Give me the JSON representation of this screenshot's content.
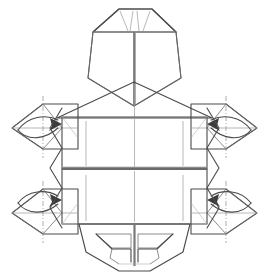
{
  "figure": {
    "title": "Origami turtle base — crease pattern with inside reverse fold arrows",
    "step_number": "",
    "caption": "",
    "background_color": "#ffffff"
  },
  "palette": {
    "paper_light": "#f2f2f0",
    "paper_mid": "#e6e6e4",
    "paper_shaded": "#c9c9c9",
    "paper_shaded_dark": "#b9b9b9",
    "edge_line": "#4a4a4a",
    "crease_line": "#9a9a9a",
    "spine_line": "#7a7a7a",
    "arrow_color": "#3c3c3c"
  },
  "parts": {
    "head": {
      "name": "head-flap",
      "label": "",
      "crease_count": 4
    },
    "shell": {
      "name": "shell-body",
      "label": "",
      "panels": 2,
      "vertical_creases": 6
    },
    "tail": {
      "name": "tail-flap",
      "label": "",
      "sub_flaps": 2
    },
    "flippers": [
      {
        "name": "flipper-front-left",
        "position": "top-left",
        "arrow_direction": "right"
      },
      {
        "name": "flipper-front-right",
        "position": "top-right",
        "arrow_direction": "left"
      },
      {
        "name": "flipper-rear-left",
        "position": "bottom-left",
        "arrow_direction": "right"
      },
      {
        "name": "flipper-rear-right",
        "position": "bottom-right",
        "arrow_direction": "left"
      }
    ]
  },
  "annotations": {
    "arrows": 4,
    "arrow_style": "curved-valley-fold",
    "axis_lines": 4,
    "axis_style": "dash-dot"
  }
}
